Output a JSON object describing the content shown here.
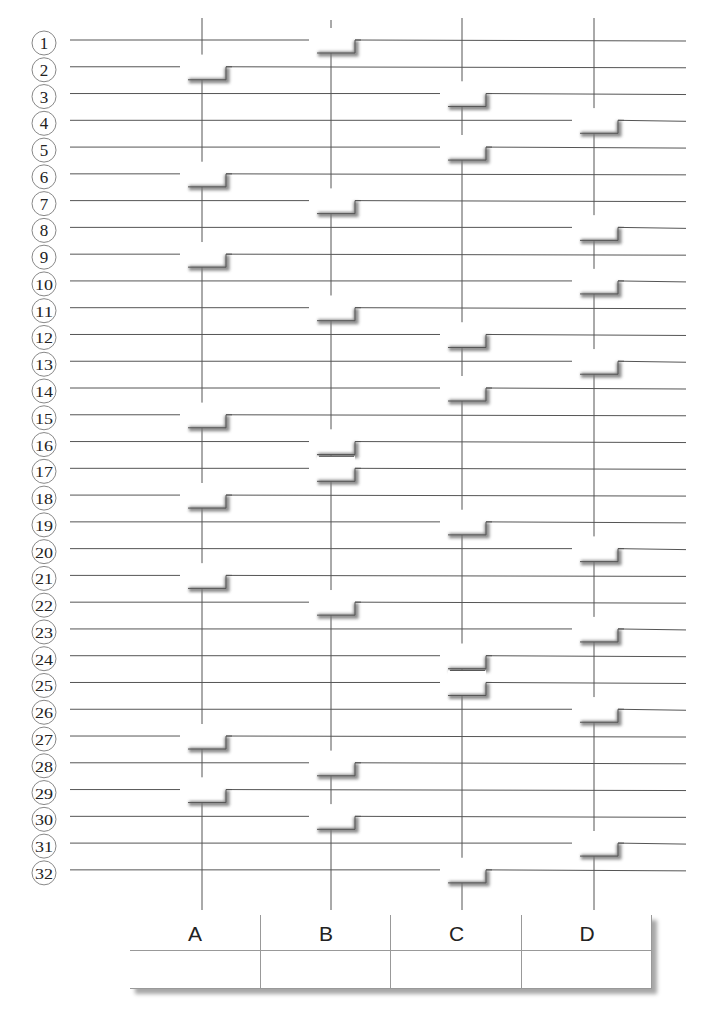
{
  "diagram": {
    "type": "amidakuji",
    "rows": [
      "1",
      "2",
      "3",
      "4",
      "5",
      "6",
      "7",
      "8",
      "9",
      "10",
      "11",
      "12",
      "13",
      "14",
      "15",
      "16",
      "17",
      "18",
      "19",
      "20",
      "21",
      "22",
      "23",
      "24",
      "25",
      "26",
      "27",
      "28",
      "29",
      "30",
      "31",
      "32"
    ],
    "columns": [
      "A",
      "B",
      "C",
      "D"
    ],
    "steps": [
      {
        "row": 1,
        "col": "B"
      },
      {
        "row": 2,
        "col": "A"
      },
      {
        "row": 3,
        "col": "C"
      },
      {
        "row": 4,
        "col": "D"
      },
      {
        "row": 5,
        "col": "C"
      },
      {
        "row": 6,
        "col": "A"
      },
      {
        "row": 7,
        "col": "B"
      },
      {
        "row": 8,
        "col": "D"
      },
      {
        "row": 9,
        "col": "A"
      },
      {
        "row": 10,
        "col": "D"
      },
      {
        "row": 11,
        "col": "B"
      },
      {
        "row": 12,
        "col": "C"
      },
      {
        "row": 13,
        "col": "D"
      },
      {
        "row": 14,
        "col": "C"
      },
      {
        "row": 15,
        "col": "A"
      },
      {
        "row": 16,
        "col": "B"
      },
      {
        "row": 17,
        "col": "B"
      },
      {
        "row": 18,
        "col": "A"
      },
      {
        "row": 19,
        "col": "C"
      },
      {
        "row": 20,
        "col": "D"
      },
      {
        "row": 21,
        "col": "A"
      },
      {
        "row": 22,
        "col": "B"
      },
      {
        "row": 23,
        "col": "D"
      },
      {
        "row": 24,
        "col": "C"
      },
      {
        "row": 25,
        "col": "C"
      },
      {
        "row": 26,
        "col": "D"
      },
      {
        "row": 27,
        "col": "A"
      },
      {
        "row": 28,
        "col": "B"
      },
      {
        "row": 29,
        "col": "A"
      },
      {
        "row": 30,
        "col": "B"
      },
      {
        "row": 31,
        "col": "D"
      },
      {
        "row": 32,
        "col": "C"
      }
    ]
  },
  "table": {
    "headers": [
      "A",
      "B",
      "C",
      "D"
    ],
    "cells": [
      "",
      "",
      "",
      ""
    ]
  },
  "colors": {
    "line": "#555555",
    "circle": "#888888",
    "text": "#222222",
    "shadow": "#777777"
  }
}
